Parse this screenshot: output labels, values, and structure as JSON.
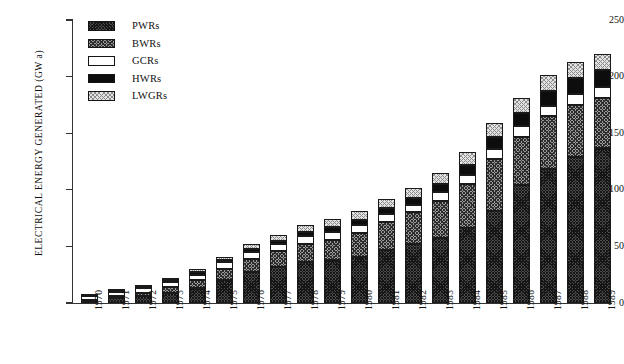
{
  "chart_data": {
    "type": "bar",
    "subtype": "stacked-bar",
    "title": "",
    "xlabel": "",
    "ylabel": "ELECTRICAL ENERGY GENERATED (GW a)",
    "ylim": [
      0,
      250
    ],
    "yticks": [
      0,
      50,
      100,
      150,
      200,
      250
    ],
    "ytick_labels": [
      "0",
      "50",
      "100",
      "150",
      "200",
      "250"
    ],
    "grid": false,
    "legend_position": "upper-left-inside",
    "categories": [
      "1970",
      "1971",
      "1972",
      "1973",
      "1974",
      "1975",
      "1976",
      "1977",
      "1978",
      "1979",
      "1980",
      "1981",
      "1982",
      "1983",
      "1984",
      "1985",
      "1986",
      "1987",
      "1988",
      "1989"
    ],
    "series": [
      {
        "name": "PWRs",
        "color": "#4a4a4a",
        "pattern": "dark-checker",
        "values": [
          2,
          4,
          6,
          9,
          13,
          20,
          27,
          32,
          36,
          38,
          41,
          47,
          52,
          57,
          66,
          81,
          104,
          118,
          129,
          137
        ]
      },
      {
        "name": "BWRs",
        "color": "#9b9b9b",
        "pattern": "medium-checker",
        "values": [
          1,
          2,
          3,
          5,
          7,
          10,
          12,
          14,
          16,
          18,
          21,
          25,
          28,
          33,
          39,
          46,
          43,
          47,
          46,
          44
        ]
      },
      {
        "name": "GCRs",
        "color": "#ffffff",
        "pattern": "solid-white",
        "values": [
          3,
          4,
          4,
          5,
          5,
          6,
          6,
          6,
          7,
          7,
          7,
          7,
          7,
          8,
          8,
          9,
          9,
          9,
          10,
          10
        ]
      },
      {
        "name": "HWRs",
        "color": "#0d0d0d",
        "pattern": "solid-black",
        "values": [
          1,
          1,
          1,
          1,
          2,
          2,
          3,
          3,
          4,
          4,
          4,
          5,
          6,
          7,
          9,
          11,
          12,
          13,
          14,
          15
        ]
      },
      {
        "name": "LWGRs",
        "color": "#e2e2e2",
        "pattern": "light-dots",
        "values": [
          0,
          1,
          1,
          2,
          3,
          3,
          4,
          5,
          6,
          7,
          8,
          8,
          9,
          10,
          11,
          12,
          13,
          14,
          14,
          14
        ]
      }
    ],
    "totals": [
      7,
      12,
      15,
      22,
      30,
      41,
      52,
      60,
      69,
      74,
      81,
      92,
      102,
      115,
      133,
      159,
      181,
      201,
      213,
      220
    ],
    "stack_order_bottom_to_top": [
      "PWRs",
      "BWRs",
      "GCRs",
      "HWRs",
      "LWGRs"
    ]
  },
  "legend": {
    "items": [
      {
        "label": "PWRs"
      },
      {
        "label": "BWRs"
      },
      {
        "label": "GCRs"
      },
      {
        "label": "HWRs"
      },
      {
        "label": "LWGRs"
      }
    ]
  }
}
